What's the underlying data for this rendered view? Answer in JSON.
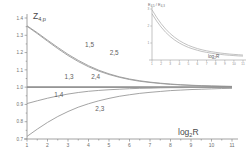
{
  "chart_data": {
    "type": "line",
    "title": "",
    "ylabel": "Z4,p",
    "ylabel_base": "Z",
    "ylabel_sub": "4,p",
    "xlabel": "log2R",
    "xlabel_base": "log",
    "xlabel_sub": "2",
    "xlabel_tail": "R",
    "xlim": [
      1,
      11
    ],
    "ylim": [
      0.7,
      1.4
    ],
    "grid": false,
    "legend": "inline-curve-labels",
    "ytick_labels": [
      "0.7",
      "0.8",
      "0.9",
      "1.0",
      "1.1",
      "1.2",
      "1.3",
      "1.4"
    ],
    "ytick_values": [
      0.7,
      0.8,
      0.9,
      1.0,
      1.1,
      1.2,
      1.3,
      1.4
    ],
    "xtick_labels": [
      "1",
      "2",
      "3",
      "4",
      "5",
      "6",
      "7",
      "8",
      "9",
      "10",
      "11"
    ],
    "xtick_values": [
      1,
      2,
      3,
      4,
      5,
      6,
      7,
      8,
      9,
      10,
      11
    ],
    "asymptote": 1.0,
    "series": [
      {
        "name": "1,5",
        "label": "1,5",
        "label_x": 4.05,
        "label_y": 1.235,
        "x": [
          1,
          1.5,
          2,
          2.5,
          3,
          3.5,
          4,
          4.5,
          5,
          5.5,
          6,
          6.5,
          7,
          7.5,
          8,
          8.5,
          9,
          9.5,
          10,
          10.5,
          11
        ],
        "y": [
          1.355,
          1.315,
          1.272,
          1.23,
          1.19,
          1.155,
          1.124,
          1.098,
          1.077,
          1.06,
          1.047,
          1.037,
          1.029,
          1.023,
          1.018,
          1.014,
          1.011,
          1.009,
          1.007,
          1.005,
          1.004
        ]
      },
      {
        "name": "2,5",
        "label": "2,5",
        "label_x": 5.25,
        "label_y": 1.185,
        "x": [
          1,
          1.5,
          2,
          2.5,
          3,
          3.5,
          4,
          4.5,
          5,
          5.5,
          6,
          6.5,
          7,
          7.5,
          8,
          8.5,
          9,
          9.5,
          10,
          10.5,
          11
        ],
        "y": [
          1.352,
          1.31,
          1.266,
          1.223,
          1.183,
          1.148,
          1.118,
          1.093,
          1.073,
          1.057,
          1.044,
          1.034,
          1.027,
          1.021,
          1.016,
          1.013,
          1.01,
          1.008,
          1.006,
          1.005,
          1.004
        ]
      },
      {
        "name": "1,3",
        "label": "1,3",
        "label_x": 3.05,
        "label_y": 1.045,
        "x": [
          1,
          2,
          3,
          4,
          5,
          6,
          7,
          8,
          9,
          10,
          11
        ],
        "y": [
          1.0,
          1.0,
          1.0,
          1.0,
          1.0,
          1.0,
          1.0,
          1.0,
          1.0,
          1.0,
          1.0
        ]
      },
      {
        "name": "2,4",
        "label": "2,4",
        "label_x": 4.35,
        "label_y": 1.045,
        "x": [
          1,
          2,
          3,
          4,
          5,
          6,
          7,
          8,
          9,
          10,
          11
        ],
        "y": [
          1.0,
          1.0,
          1.0,
          1.0,
          1.0,
          1.0,
          1.0,
          1.0,
          1.0,
          1.0,
          1.0
        ]
      },
      {
        "name": "1,4",
        "label": "1,4",
        "label_x": 2.55,
        "label_y": 0.945,
        "x": [
          1,
          1.5,
          2,
          2.5,
          3,
          3.5,
          4,
          4.5,
          5,
          5.5,
          6,
          6.5,
          7,
          7.5,
          8,
          8.5,
          9,
          9.5,
          10,
          10.5,
          11
        ],
        "y": [
          0.905,
          0.921,
          0.936,
          0.949,
          0.96,
          0.969,
          0.976,
          0.981,
          0.985,
          0.988,
          0.991,
          0.993,
          0.994,
          0.996,
          0.997,
          0.997,
          0.998,
          0.998,
          0.999,
          0.999,
          0.999
        ]
      },
      {
        "name": "2,3",
        "label": "2,3",
        "label_x": 4.55,
        "label_y": 0.862,
        "x": [
          1,
          1.5,
          2,
          2.5,
          3,
          3.5,
          4,
          4.5,
          5,
          5.5,
          6,
          6.5,
          7,
          7.5,
          8,
          8.5,
          9,
          9.5,
          10,
          10.5,
          11
        ],
        "y": [
          0.715,
          0.757,
          0.796,
          0.83,
          0.859,
          0.884,
          0.904,
          0.921,
          0.935,
          0.947,
          0.956,
          0.964,
          0.97,
          0.975,
          0.98,
          0.983,
          0.986,
          0.988,
          0.99,
          0.992,
          0.993
        ]
      }
    ],
    "inset": {
      "type": "line",
      "ylabel": "E4,5 / E4,3",
      "ylabel_num_base": "E",
      "ylabel_num_sub": "4,5",
      "ylabel_den_base": "E",
      "ylabel_den_sub": "4,3",
      "xlabel": "log2R",
      "xlabel_base": "log",
      "xlabel_sub": "2",
      "xlabel_tail": "R",
      "xlim": [
        1,
        11
      ],
      "ylim": [
        0,
        3
      ],
      "ytick_labels": [
        "1",
        "2",
        "3"
      ],
      "ytick_values": [
        1,
        2,
        3
      ],
      "xtick_labels": [
        "1",
        "2",
        "3",
        "4",
        "5",
        "6",
        "7",
        "8",
        "9",
        "10",
        "11"
      ],
      "xtick_values": [
        1,
        2,
        3,
        4,
        5,
        6,
        7,
        8,
        9,
        10,
        11
      ],
      "series": [
        {
          "name": "upper",
          "x": [
            1,
            1.5,
            2,
            2.5,
            3,
            3.5,
            4,
            4.5,
            5,
            5.5,
            6,
            6.5,
            7,
            7.5,
            8,
            8.5,
            9,
            9.5,
            10,
            10.5,
            11
          ],
          "y": [
            2.95,
            2.52,
            2.14,
            1.82,
            1.55,
            1.33,
            1.14,
            0.99,
            0.86,
            0.76,
            0.67,
            0.6,
            0.54,
            0.49,
            0.45,
            0.41,
            0.38,
            0.35,
            0.33,
            0.31,
            0.29
          ]
        },
        {
          "name": "lower",
          "x": [
            1,
            1.5,
            2,
            2.5,
            3,
            3.5,
            4,
            4.5,
            5,
            5.5,
            6,
            6.5,
            7,
            7.5,
            8,
            8.5,
            9,
            9.5,
            10,
            10.5,
            11
          ],
          "y": [
            2.72,
            2.3,
            1.94,
            1.63,
            1.38,
            1.17,
            1.0,
            0.86,
            0.74,
            0.65,
            0.57,
            0.5,
            0.45,
            0.4,
            0.36,
            0.33,
            0.3,
            0.28,
            0.26,
            0.24,
            0.23
          ]
        }
      ]
    }
  },
  "colors": {
    "axis": "#8a8a8a",
    "curve": "#9a9a9a",
    "text": "#5a5a5a",
    "background": "#ffffff"
  }
}
